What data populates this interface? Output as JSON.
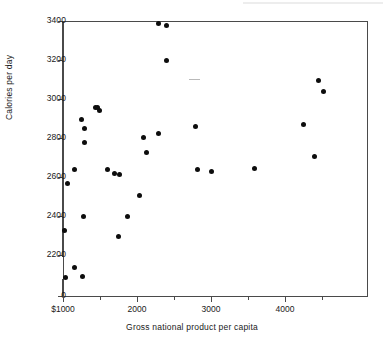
{
  "chart_data": {
    "type": "scatter",
    "title": "",
    "xlabel": "Gross national product per capita",
    "ylabel": "Calories per day",
    "xlim": [
      1000,
      4700
    ],
    "ylim": [
      2000,
      3400
    ],
    "y_axis_break": true,
    "y_zero_label": "0",
    "grid": false,
    "legend": null,
    "xticks": [
      {
        "value": 1000,
        "label": "$1000"
      },
      {
        "value": 1500,
        "label": ""
      },
      {
        "value": 2000,
        "label": "2000"
      },
      {
        "value": 2500,
        "label": ""
      },
      {
        "value": 3000,
        "label": "3000"
      },
      {
        "value": 3500,
        "label": ""
      },
      {
        "value": 4000,
        "label": "4000"
      },
      {
        "value": 4500,
        "label": ""
      }
    ],
    "yticks": [
      {
        "value": 0,
        "label": "0"
      },
      {
        "value": 2200,
        "label": "2200"
      },
      {
        "value": 2400,
        "label": "2400"
      },
      {
        "value": 2600,
        "label": "2600"
      },
      {
        "value": 2800,
        "label": "2800"
      },
      {
        "value": 3000,
        "label": "3000"
      },
      {
        "value": 3200,
        "label": "3200"
      },
      {
        "value": 3400,
        "label": "3400"
      }
    ],
    "points": [
      {
        "x": 1015,
        "y": 2325
      },
      {
        "x": 1040,
        "y": 2085
      },
      {
        "x": 1055,
        "y": 2565
      },
      {
        "x": 1150,
        "y": 2135
      },
      {
        "x": 1150,
        "y": 2640
      },
      {
        "x": 1270,
        "y": 2090
      },
      {
        "x": 1245,
        "y": 2895
      },
      {
        "x": 1285,
        "y": 2850
      },
      {
        "x": 1290,
        "y": 2775
      },
      {
        "x": 1280,
        "y": 2395
      },
      {
        "x": 1440,
        "y": 2955
      },
      {
        "x": 1490,
        "y": 2940
      },
      {
        "x": 1460,
        "y": 2955
      },
      {
        "x": 1600,
        "y": 2640
      },
      {
        "x": 1690,
        "y": 2620
      },
      {
        "x": 1755,
        "y": 2295
      },
      {
        "x": 1760,
        "y": 2615
      },
      {
        "x": 1875,
        "y": 2400
      },
      {
        "x": 2035,
        "y": 2505
      },
      {
        "x": 2085,
        "y": 2805
      },
      {
        "x": 2130,
        "y": 2725
      },
      {
        "x": 2290,
        "y": 3385
      },
      {
        "x": 2400,
        "y": 3375
      },
      {
        "x": 2295,
        "y": 2825
      },
      {
        "x": 2400,
        "y": 3200
      },
      {
        "x": 2790,
        "y": 2860
      },
      {
        "x": 2815,
        "y": 2640
      },
      {
        "x": 3010,
        "y": 2630
      },
      {
        "x": 3585,
        "y": 2645
      },
      {
        "x": 4245,
        "y": 2870
      },
      {
        "x": 4455,
        "y": 3095
      },
      {
        "x": 4525,
        "y": 3040
      },
      {
        "x": 4395,
        "y": 2705
      }
    ]
  },
  "axes": {
    "y_title": "Calories per day",
    "x_title": "Gross national product per capita"
  }
}
